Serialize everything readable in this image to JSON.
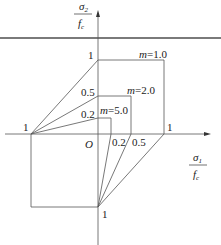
{
  "diagram": {
    "type": "failure-envelope",
    "y_axis": {
      "numerator": "σ",
      "num_sub": "2",
      "denominator": "f",
      "den_sub": "c"
    },
    "x_axis": {
      "numerator": "σ",
      "num_sub": "1",
      "denominator": "f",
      "den_sub": "c"
    },
    "origin_label": "O",
    "left_label": "1",
    "bottom_label": "1",
    "right_label": "1",
    "y_ticks": [
      "1",
      "0.5",
      "0.2"
    ],
    "x_ticks": [
      "0.2",
      "0.5"
    ],
    "curves": [
      {
        "label": "m=1.0",
        "m_text": "m",
        "value_text": "=1.0",
        "tension": 1.0
      },
      {
        "label": "m=2.0",
        "m_text": "m",
        "value_text": "=2.0",
        "tension": 0.5
      },
      {
        "label": "m=5.0",
        "m_text": "m",
        "value_text": "=5.0",
        "tension": 0.2
      }
    ]
  }
}
